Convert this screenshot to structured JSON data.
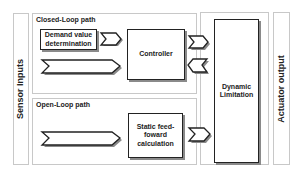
{
  "diagram": {
    "left_panel": {
      "label": "Sensor Inputs"
    },
    "right_panel": {
      "label": "Actuator output"
    },
    "closed_loop": {
      "title": "Closed-Loop path",
      "demand_block": "Demand value determination",
      "controller_block": "Controller"
    },
    "open_loop": {
      "title": "Open-Loop path",
      "static_block": "Static feed-foward calculation"
    },
    "limitation": {
      "block": "Dynamic Limitation"
    },
    "arrows": [
      {
        "name": "demand-to-controller",
        "direction": "right"
      },
      {
        "name": "sensor-to-controller",
        "direction": "right"
      },
      {
        "name": "controller-to-limitation",
        "direction": "right"
      },
      {
        "name": "limitation-to-controller",
        "direction": "left"
      },
      {
        "name": "sensor-to-static",
        "direction": "right"
      },
      {
        "name": "static-to-limitation",
        "direction": "right"
      }
    ],
    "colors": {
      "stroke": "#222222",
      "shadow": "#8a8a8a",
      "panel_border": "#c8c8c8"
    }
  }
}
